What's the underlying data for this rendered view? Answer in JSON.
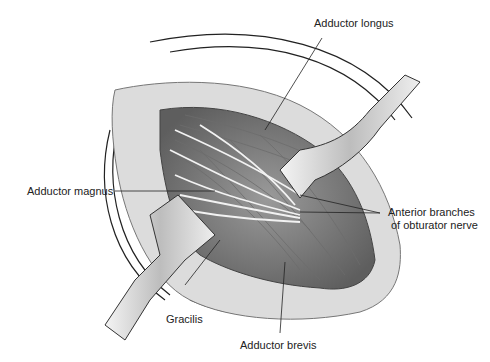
{
  "figure": {
    "labels": {
      "adductor_longus": "Adductor longus",
      "adductor_magnus": "Adductor magnus",
      "anterior_branches_line1": "Anterior branches",
      "anterior_branches_line2": "of obturator nerve",
      "gracilis": "Gracilis",
      "adductor_brevis": "Adductor brevis"
    },
    "colors": {
      "line": "#222222",
      "skin": "#d8d8d8",
      "muscle": "#8a8a8a",
      "nerve": "#f2f2f2",
      "retractor": "#c8c8c8"
    }
  }
}
